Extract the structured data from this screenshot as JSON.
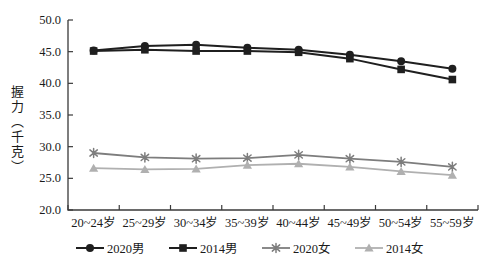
{
  "figure": {
    "background": "#ffffff",
    "axis_color": "#3a3a3a"
  },
  "chart_data": {
    "type": "line",
    "title": "",
    "xlabel": "",
    "ylabel": "握力（千克）",
    "categories": [
      "20~24岁",
      "25~29岁",
      "30~34岁",
      "35~39岁",
      "40~44岁",
      "45~49岁",
      "50~54岁",
      "55~59岁"
    ],
    "series": [
      {
        "id": "male-2020",
        "name": "2020男",
        "marker": "circle",
        "color": "#1f1f1f",
        "line_width": 2,
        "values": [
          45.2,
          45.9,
          46.1,
          45.6,
          45.3,
          44.5,
          43.5,
          42.3
        ]
      },
      {
        "id": "male-2014",
        "name": "2014男",
        "marker": "square",
        "color": "#1f1f1f",
        "line_width": 2,
        "values": [
          45.1,
          45.3,
          45.1,
          45.1,
          44.9,
          43.9,
          42.2,
          40.6
        ]
      },
      {
        "id": "female-2020",
        "name": "2020女",
        "marker": "star",
        "color": "#7d7d7d",
        "line_width": 1.8,
        "values": [
          29.0,
          28.3,
          28.1,
          28.2,
          28.7,
          28.1,
          27.6,
          26.8
        ]
      },
      {
        "id": "female-2014",
        "name": "2014女",
        "marker": "triangle",
        "color": "#b0b0b0",
        "line_width": 1.8,
        "values": [
          26.6,
          26.4,
          26.5,
          27.1,
          27.3,
          26.8,
          26.1,
          25.5
        ]
      }
    ],
    "ylim": [
      20.0,
      50.0
    ],
    "ytick_step": 5,
    "ytick_labels": [
      "20.0",
      "25.0",
      "30.0",
      "35.0",
      "40.0",
      "45.0",
      "50.0"
    ],
    "grid": false,
    "legend_position": "bottom"
  }
}
